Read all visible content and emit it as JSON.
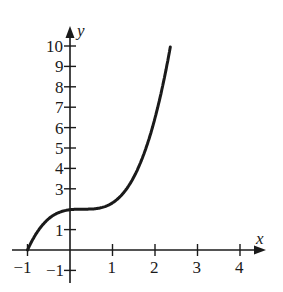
{
  "chart_data": {
    "type": "line",
    "title": "",
    "xlabel": "x",
    "ylabel": "y",
    "xlim": [
      -1,
      4.3
    ],
    "ylim": [
      -1,
      10.5
    ],
    "x_ticks": [
      "-1",
      "1",
      "2",
      "3",
      "4"
    ],
    "y_ticks": [
      "-1",
      "1",
      "3",
      "4",
      "5",
      "6",
      "7",
      "8",
      "9",
      "10"
    ],
    "grid": false,
    "legend": null,
    "series": [
      {
        "name": "curve",
        "x": [
          -1,
          -0.75,
          -0.5,
          -0.25,
          0,
          0.25,
          0.5,
          0.75,
          1,
          1.25,
          1.5,
          1.75,
          2,
          2.2,
          2.38
        ],
        "values": [
          0,
          0.7,
          1.53,
          1.85,
          1.97,
          2.0,
          2.01,
          2.08,
          2.31,
          2.78,
          3.57,
          4.77,
          6.47,
          8.2,
          10
        ]
      }
    ]
  },
  "labels": {
    "x_axis": "x",
    "y_axis": "y"
  },
  "colors": {
    "ink": "#1a1a1a",
    "background": "#ffffff"
  }
}
